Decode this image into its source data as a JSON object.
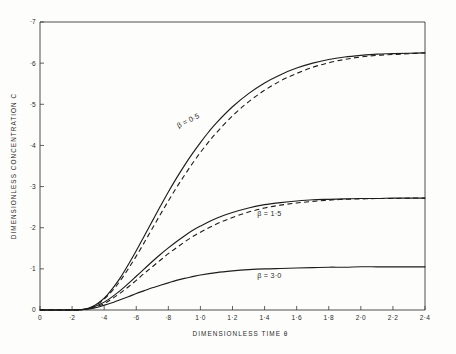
{
  "chart_data": {
    "type": "line",
    "title": "",
    "xlabel": "DIMENSIONLESS TIME  θ",
    "ylabel": "DIMENSIONLESS  CONCENTRATION  C",
    "xlim": [
      0,
      2.4
    ],
    "ylim": [
      0,
      0.7
    ],
    "grid": false,
    "legend_position": "inline-curve-labels",
    "x_ticks": [
      "0",
      "·2",
      "·4",
      "·6",
      "·8",
      "1·0",
      "1·2",
      "1·4",
      "1·6",
      "1·8",
      "2·0",
      "2·2",
      "2·4"
    ],
    "x_tick_values": [
      0,
      0.2,
      0.4,
      0.6,
      0.8,
      1.0,
      1.2,
      1.4,
      1.6,
      1.8,
      2.0,
      2.2,
      2.4
    ],
    "y_ticks": [
      "0",
      "·1",
      "·2",
      "·3",
      "·4",
      "·5",
      "·6",
      "·7"
    ],
    "y_tick_values": [
      0,
      0.1,
      0.2,
      0.3,
      0.4,
      0.5,
      0.6,
      0.7
    ],
    "annotations": [
      {
        "text": "β = 0·5",
        "x": 0.93,
        "y": 0.455,
        "rotate": -27
      },
      {
        "text": "β = 1·5",
        "x": 1.43,
        "y": 0.228,
        "rotate": 0
      },
      {
        "text": "β = 3·0",
        "x": 1.43,
        "y": 0.077,
        "rotate": 0
      }
    ],
    "series": [
      {
        "name": "β = 0·5 (solid)",
        "style": "solid",
        "plateau": 0.625,
        "x": [
          0.0,
          0.2,
          0.26,
          0.3,
          0.34,
          0.38,
          0.42,
          0.46,
          0.5,
          0.55,
          0.6,
          0.65,
          0.7,
          0.75,
          0.8,
          0.85,
          0.9,
          0.95,
          1.0,
          1.05,
          1.1,
          1.2,
          1.3,
          1.4,
          1.5,
          1.6,
          1.7,
          1.8,
          1.9,
          2.0,
          2.1,
          2.2,
          2.3,
          2.4
        ],
        "y": [
          0.0,
          0.0,
          0.001,
          0.004,
          0.011,
          0.022,
          0.037,
          0.056,
          0.078,
          0.11,
          0.144,
          0.18,
          0.216,
          0.252,
          0.287,
          0.32,
          0.351,
          0.38,
          0.407,
          0.432,
          0.455,
          0.494,
          0.526,
          0.552,
          0.572,
          0.588,
          0.6,
          0.609,
          0.615,
          0.619,
          0.622,
          0.623,
          0.624,
          0.625
        ]
      },
      {
        "name": "β = 0·5 (dashed)",
        "style": "dashed",
        "plateau": 0.625,
        "x": [
          0.0,
          0.2,
          0.26,
          0.3,
          0.34,
          0.38,
          0.42,
          0.46,
          0.5,
          0.55,
          0.6,
          0.65,
          0.7,
          0.75,
          0.8,
          0.85,
          0.9,
          0.95,
          1.0,
          1.05,
          1.1,
          1.2,
          1.3,
          1.4,
          1.5,
          1.6,
          1.7,
          1.8,
          1.9,
          2.0,
          2.1,
          2.2,
          2.3,
          2.4
        ],
        "y": [
          0.0,
          0.0,
          0.001,
          0.004,
          0.01,
          0.02,
          0.034,
          0.051,
          0.071,
          0.1,
          0.131,
          0.164,
          0.198,
          0.232,
          0.265,
          0.297,
          0.327,
          0.356,
          0.383,
          0.408,
          0.431,
          0.472,
          0.506,
          0.534,
          0.557,
          0.575,
          0.59,
          0.601,
          0.609,
          0.615,
          0.619,
          0.621,
          0.623,
          0.625
        ]
      },
      {
        "name": "β = 1·5 (solid)",
        "style": "solid",
        "plateau": 0.272,
        "x": [
          0.0,
          0.2,
          0.26,
          0.3,
          0.34,
          0.38,
          0.42,
          0.46,
          0.5,
          0.55,
          0.6,
          0.65,
          0.7,
          0.75,
          0.8,
          0.85,
          0.9,
          0.95,
          1.0,
          1.1,
          1.2,
          1.3,
          1.4,
          1.5,
          1.6,
          1.7,
          1.8,
          1.9,
          2.0,
          2.1,
          2.2,
          2.3,
          2.4
        ],
        "y": [
          0.0,
          0.0,
          0.001,
          0.003,
          0.008,
          0.015,
          0.024,
          0.035,
          0.047,
          0.064,
          0.082,
          0.1,
          0.118,
          0.135,
          0.151,
          0.166,
          0.18,
          0.193,
          0.204,
          0.223,
          0.237,
          0.248,
          0.256,
          0.261,
          0.265,
          0.268,
          0.269,
          0.27,
          0.271,
          0.271,
          0.272,
          0.272,
          0.272
        ]
      },
      {
        "name": "β = 1·5 (dashed)",
        "style": "dashed",
        "plateau": 0.272,
        "x": [
          0.0,
          0.2,
          0.26,
          0.3,
          0.34,
          0.38,
          0.42,
          0.46,
          0.5,
          0.55,
          0.6,
          0.65,
          0.7,
          0.75,
          0.8,
          0.85,
          0.9,
          0.95,
          1.0,
          1.1,
          1.2,
          1.3,
          1.4,
          1.5,
          1.6,
          1.7,
          1.8,
          1.9,
          2.0,
          2.1,
          2.2,
          2.3,
          2.4
        ],
        "y": [
          0.0,
          0.0,
          0.001,
          0.002,
          0.006,
          0.012,
          0.02,
          0.03,
          0.041,
          0.056,
          0.072,
          0.089,
          0.105,
          0.121,
          0.137,
          0.151,
          0.165,
          0.178,
          0.189,
          0.209,
          0.225,
          0.238,
          0.248,
          0.255,
          0.26,
          0.264,
          0.267,
          0.269,
          0.27,
          0.271,
          0.271,
          0.272,
          0.272
        ]
      },
      {
        "name": "β = 3·0 (solid)",
        "style": "solid",
        "plateau": 0.105,
        "x": [
          0.0,
          0.2,
          0.26,
          0.3,
          0.34,
          0.38,
          0.42,
          0.46,
          0.5,
          0.55,
          0.6,
          0.65,
          0.7,
          0.75,
          0.8,
          0.85,
          0.9,
          0.95,
          1.0,
          1.1,
          1.2,
          1.3,
          1.4,
          1.5,
          1.6,
          1.7,
          1.8,
          1.9,
          2.0,
          2.1,
          2.2,
          2.3,
          2.4
        ],
        "y": [
          0.0,
          0.0,
          0.001,
          0.002,
          0.005,
          0.009,
          0.014,
          0.019,
          0.025,
          0.032,
          0.04,
          0.047,
          0.054,
          0.06,
          0.066,
          0.072,
          0.077,
          0.081,
          0.085,
          0.091,
          0.095,
          0.098,
          0.1,
          0.101,
          0.102,
          0.103,
          0.104,
          0.104,
          0.105,
          0.105,
          0.105,
          0.105,
          0.105
        ]
      }
    ]
  }
}
